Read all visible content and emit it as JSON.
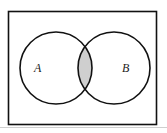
{
  "diagram": {
    "type": "venn",
    "sets": [
      {
        "label": "A"
      },
      {
        "label": "B"
      }
    ],
    "shaded_region": "A ∩ B",
    "colors": {
      "stroke": "#111111",
      "shade": "#cfcfcf",
      "background": "#ffffff"
    }
  }
}
